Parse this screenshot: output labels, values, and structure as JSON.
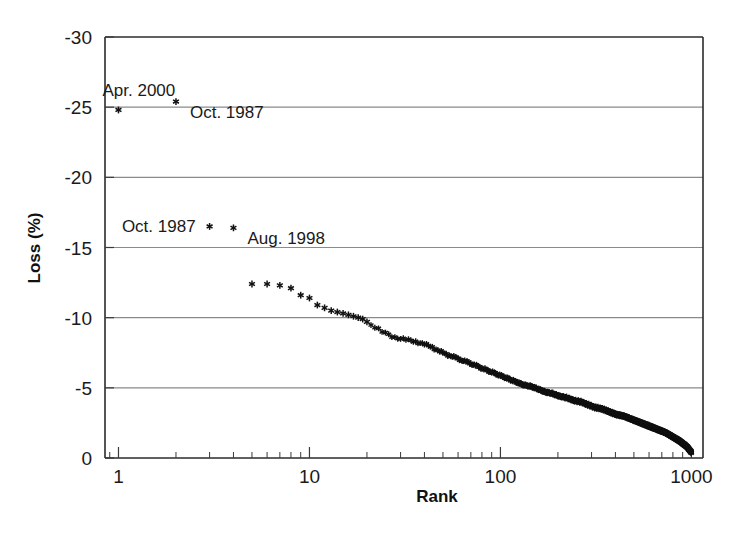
{
  "chart_data": {
    "type": "scatter",
    "title": "",
    "xlabel": "Rank",
    "ylabel": "Loss (%)",
    "xscale": "log",
    "xlim": [
      0.85,
      1150
    ],
    "ylim": [
      -30,
      0
    ],
    "yaxis_direction": "top_is_most_negative",
    "grid": "horizontal-only",
    "legend": "none",
    "x_tick_labels": [
      "1",
      "10",
      "100",
      "1000"
    ],
    "x_tick_values": [
      1,
      10,
      100,
      1000
    ],
    "y_tick_labels": [
      "-30",
      "-25",
      "-20",
      "-15",
      "-10",
      "-5",
      "0"
    ],
    "y_tick_values": [
      -30,
      -25,
      -20,
      -15,
      -10,
      -5,
      0
    ],
    "marker_style": "asterisk",
    "marker_color": "#111111",
    "series": [
      {
        "name": "Ranked daily losses",
        "x": [
          1,
          2,
          3,
          4,
          5,
          6,
          7,
          8,
          9,
          10,
          11,
          12,
          13,
          14,
          15,
          16,
          17,
          18,
          19,
          20,
          22,
          24,
          26,
          28,
          30,
          33,
          36,
          40,
          44,
          48,
          52,
          57,
          62,
          68,
          74,
          80,
          87,
          95,
          103,
          112,
          122,
          133,
          145,
          158,
          172,
          187,
          204,
          222,
          242,
          264,
          287,
          313,
          341,
          371,
          404,
          440,
          479,
          522,
          569,
          620,
          675,
          735,
          800,
          871,
          949,
          1000
        ],
        "y": [
          -24.8,
          -25.4,
          -16.5,
          -16.4,
          -12.4,
          -12.4,
          -12.3,
          -12.1,
          -11.6,
          -11.4,
          -10.9,
          -10.7,
          -10.5,
          -10.4,
          -10.3,
          -10.2,
          -10.1,
          -10.0,
          -9.9,
          -9.7,
          -9.3,
          -9.0,
          -8.8,
          -8.6,
          -8.5,
          -8.4,
          -8.3,
          -8.1,
          -7.9,
          -7.6,
          -7.4,
          -7.2,
          -7.0,
          -6.8,
          -6.6,
          -6.4,
          -6.2,
          -6.0,
          -5.8,
          -5.6,
          -5.4,
          -5.2,
          -5.1,
          -4.9,
          -4.7,
          -4.6,
          -4.4,
          -4.3,
          -4.1,
          -4.0,
          -3.8,
          -3.6,
          -3.5,
          -3.3,
          -3.1,
          -3.0,
          -2.8,
          -2.6,
          -2.4,
          -2.2,
          -2.0,
          -1.8,
          -1.5,
          -1.2,
          -0.8,
          -0.4
        ]
      }
    ],
    "annotations": [
      {
        "id": "apr-2000",
        "text": "Apr. 2000",
        "rank": 1,
        "loss": -24.8,
        "align": "above-right"
      },
      {
        "id": "oct-1987-a",
        "text": "Oct. 1987",
        "rank": 2,
        "loss": -25.4,
        "align": "right"
      },
      {
        "id": "oct-1987-b",
        "text": "Oct. 1987",
        "rank": 3,
        "loss": -16.5,
        "align": "left"
      },
      {
        "id": "aug-1998",
        "text": "Aug. 1998",
        "rank": 4,
        "loss": -16.4,
        "align": "right"
      }
    ]
  }
}
